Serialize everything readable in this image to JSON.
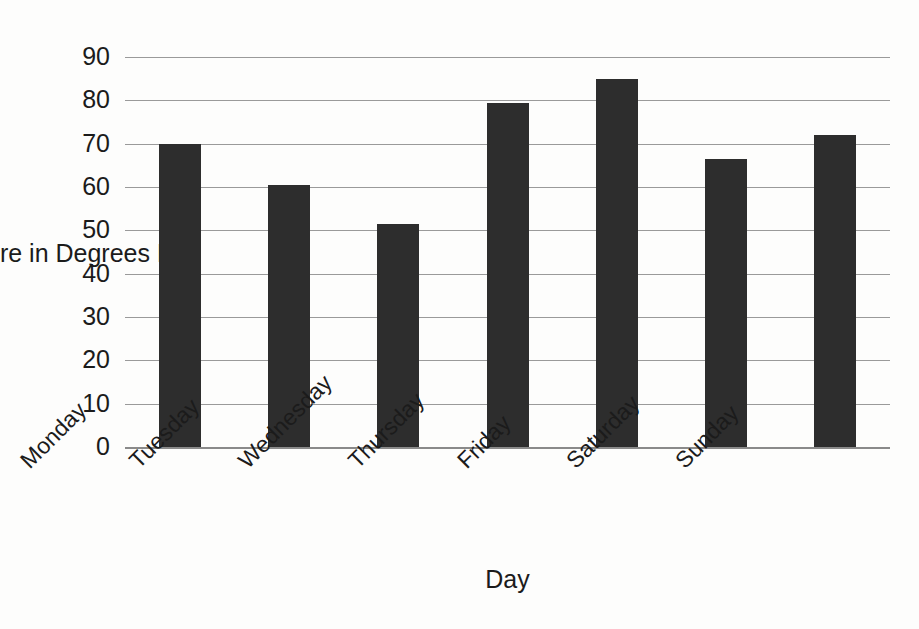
{
  "chart_data": {
    "type": "bar",
    "title": "",
    "xlabel": "Day",
    "ylabel": "Temperature in Degrees F",
    "categories": [
      "Monday",
      "Tuesday",
      "Wednesday",
      "Thursday",
      "Friday",
      "Saturday",
      "Sunday"
    ],
    "values": [
      70,
      60.5,
      51.5,
      79.5,
      85,
      66.5,
      72
    ],
    "ylim": [
      0,
      90
    ],
    "ytick_labels": [
      "0",
      "10",
      "20",
      "30",
      "40",
      "50",
      "60",
      "70",
      "80",
      "90"
    ],
    "ytick_values": [
      0,
      10,
      20,
      30,
      40,
      50,
      60,
      70,
      80,
      90
    ],
    "grid": "horizontal",
    "legend": "none",
    "bar_color": "#2d2d2d",
    "gridline_color": "#9a9a9a",
    "background_color": "#fdfdfc",
    "xtick_rotation_degrees": 45
  }
}
